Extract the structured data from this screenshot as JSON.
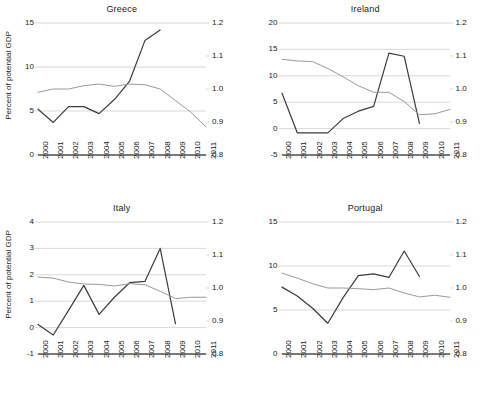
{
  "figure": {
    "panel_titles": [
      "Greece",
      "Ireland",
      "Italy",
      "Portugal"
    ],
    "y_axis_label": "Percent of potential GDP",
    "colors": {
      "series_primary": "#3b3b3b",
      "series_secondary": "#9a9a9a",
      "gridline": "#d9d9d9",
      "axis": "#4d4d4d",
      "text": "#1a1a1a",
      "background": "#ffffff"
    }
  },
  "chart_data": [
    {
      "type": "line",
      "title": "Greece",
      "xlabel": "",
      "ylabel": "Percent of potential GDP",
      "grid": true,
      "legend": "none",
      "x": [
        "2000",
        "2001",
        "2002",
        "2003",
        "2004",
        "2005",
        "2006",
        "2007",
        "2008",
        "2009",
        "2010",
        "2011"
      ],
      "xlim": [
        2000,
        2011
      ],
      "ylim": [
        0,
        15
      ],
      "yticks": [
        "0",
        "5",
        "10",
        "15"
      ],
      "ylim_right": [
        0.8,
        1.2
      ],
      "yticks_right": [
        "0.8",
        "0.9",
        "1.0",
        "1.1",
        "1.2"
      ],
      "series": [
        {
          "name": "primary-left-axis",
          "axis": "left",
          "color": "#3b3b3b",
          "x": [
            "2000",
            "2001",
            "2002",
            "2003",
            "2004",
            "2005",
            "2006",
            "2007",
            "2008"
          ],
          "values": [
            5.2,
            3.7,
            5.5,
            5.5,
            4.7,
            6.3,
            8.4,
            13.0,
            14.2
          ]
        },
        {
          "name": "secondary-right-axis",
          "axis": "right",
          "color": "#9a9a9a",
          "x": [
            "2000",
            "2001",
            "2002",
            "2003",
            "2004",
            "2005",
            "2006",
            "2007",
            "2008",
            "2009",
            "2010",
            "2011"
          ],
          "values": [
            0.99,
            1.0,
            1.0,
            1.01,
            1.015,
            1.008,
            1.015,
            1.013,
            1.0,
            0.965,
            0.93,
            0.885
          ]
        }
      ]
    },
    {
      "type": "line",
      "title": "Ireland",
      "xlabel": "",
      "ylabel": "",
      "grid": true,
      "legend": "none",
      "x": [
        "2000",
        "2001",
        "2002",
        "2003",
        "2004",
        "2005",
        "2006",
        "2007",
        "2008",
        "2009",
        "2010",
        "2011"
      ],
      "xlim": [
        2000,
        2011
      ],
      "ylim": [
        -5,
        20
      ],
      "yticks": [
        "-5",
        "0",
        "5",
        "10",
        "15",
        "20"
      ],
      "ylim_right": [
        0.8,
        1.2
      ],
      "yticks_right": [
        "0.8",
        "0.9",
        "1.0",
        "1.1",
        "1.2"
      ],
      "series": [
        {
          "name": "primary-left-axis",
          "axis": "left",
          "color": "#3b3b3b",
          "x": [
            "2000",
            "2001",
            "2002",
            "2003",
            "2004",
            "2005",
            "2006",
            "2007",
            "2008",
            "2009"
          ],
          "values": [
            6.7,
            -0.8,
            -0.8,
            -0.8,
            1.9,
            3.3,
            4.2,
            14.3,
            13.7,
            1.0
          ]
        },
        {
          "name": "secondary-right-axis",
          "axis": "right",
          "color": "#9a9a9a",
          "x": [
            "2000",
            "2001",
            "2002",
            "2003",
            "2004",
            "2005",
            "2006",
            "2007",
            "2008",
            "2009",
            "2010",
            "2011"
          ],
          "values": [
            1.09,
            1.085,
            1.083,
            1.062,
            1.037,
            1.01,
            0.99,
            0.99,
            0.962,
            0.922,
            0.925,
            0.938
          ]
        }
      ]
    },
    {
      "type": "line",
      "title": "Italy",
      "xlabel": "",
      "ylabel": "Percent of potential GDP",
      "grid": true,
      "legend": "none",
      "x": [
        "2000",
        "2001",
        "2002",
        "2003",
        "2004",
        "2005",
        "2006",
        "2007",
        "2008",
        "2009",
        "2010",
        "2011"
      ],
      "xlim": [
        2000,
        2011
      ],
      "ylim": [
        -1,
        4
      ],
      "yticks": [
        "-1",
        "0",
        "1",
        "2",
        "3",
        "4"
      ],
      "ylim_right": [
        0.8,
        1.2
      ],
      "yticks_right": [
        "0.8",
        "0.9",
        "1.0",
        "1.1",
        "1.2"
      ],
      "series": [
        {
          "name": "primary-left-axis",
          "axis": "left",
          "color": "#3b3b3b",
          "x": [
            "2000",
            "2001",
            "2002",
            "2003",
            "2004",
            "2005",
            "2006",
            "2007",
            "2008",
            "2009"
          ],
          "values": [
            0.12,
            -0.28,
            0.65,
            1.6,
            0.5,
            1.15,
            1.7,
            1.75,
            3.0,
            0.15
          ]
        },
        {
          "name": "secondary-right-axis",
          "axis": "right",
          "color": "#9a9a9a",
          "x": [
            "2000",
            "2001",
            "2002",
            "2003",
            "2004",
            "2005",
            "2006",
            "2007",
            "2008",
            "2009",
            "2010",
            "2011"
          ],
          "values": [
            1.033,
            1.03,
            1.018,
            1.012,
            1.011,
            1.006,
            1.013,
            1.01,
            0.99,
            0.968,
            0.972,
            0.972
          ]
        }
      ]
    },
    {
      "type": "line",
      "title": "Portugal",
      "xlabel": "",
      "ylabel": "",
      "grid": true,
      "legend": "none",
      "x": [
        "2000",
        "2001",
        "2002",
        "2003",
        "2004",
        "2005",
        "2006",
        "2007",
        "2008",
        "2009",
        "2010",
        "2011"
      ],
      "xlim": [
        2000,
        2011
      ],
      "ylim": [
        0,
        15
      ],
      "yticks": [
        "0",
        "5",
        "10",
        "15"
      ],
      "ylim_right": [
        0.8,
        1.2
      ],
      "yticks_right": [
        "0.8",
        "0.9",
        "1.0",
        "1.1",
        "1.2"
      ],
      "series": [
        {
          "name": "primary-left-axis",
          "axis": "left",
          "color": "#3b3b3b",
          "x": [
            "2000",
            "2001",
            "2002",
            "2003",
            "2004",
            "2005",
            "2006",
            "2007",
            "2008",
            "2009"
          ],
          "values": [
            7.6,
            6.6,
            5.2,
            3.5,
            6.4,
            8.9,
            9.1,
            8.7,
            11.7,
            8.8
          ]
        },
        {
          "name": "secondary-right-axis",
          "axis": "right",
          "color": "#9a9a9a",
          "x": [
            "2000",
            "2001",
            "2002",
            "2003",
            "2004",
            "2005",
            "2006",
            "2007",
            "2008",
            "2009",
            "2010",
            "2011"
          ],
          "values": [
            1.045,
            1.03,
            1.013,
            1.0,
            1.0,
            0.998,
            0.995,
            1.0,
            0.985,
            0.973,
            0.978,
            0.972
          ]
        }
      ]
    }
  ]
}
